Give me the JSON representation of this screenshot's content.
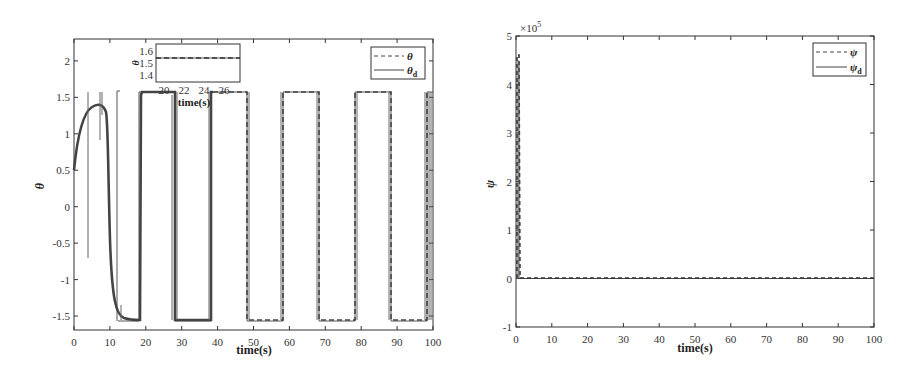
{
  "chart_data": [
    {
      "type": "line",
      "title": "",
      "xlabel": "time(s)",
      "ylabel": "θ",
      "xlim": [
        0,
        100
      ],
      "ylim": [
        -1.7,
        2.3
      ],
      "xticks": [
        0,
        10,
        20,
        30,
        40,
        50,
        60,
        70,
        80,
        90,
        100
      ],
      "yticks": [
        -1.5,
        -1,
        -0.5,
        0,
        0.5,
        1,
        1.5,
        2
      ],
      "ytick_labels": [
        "-1.5",
        "-1",
        "-0.5",
        "0",
        "0.5",
        "1",
        "1.5",
        "2"
      ],
      "grid": false,
      "legend_position": "upper right",
      "series": [
        {
          "name": "θ",
          "style": "dashed",
          "description": "actual attitude angle; initial transient rises from ~0.5 to ~1.35 around t=5-7s, drops to ~-1.57 by t≈12s, then tracks square wave"
        },
        {
          "name": "θ_d",
          "style": "solid",
          "description": "desired square wave alternating between 1.57 and -1.57"
        }
      ],
      "square_wave": {
        "high": 1.57,
        "low": -1.57,
        "high_intervals": [
          [
            18,
            28
          ],
          [
            38,
            48
          ],
          [
            58,
            68
          ],
          [
            78,
            88
          ],
          [
            98,
            100
          ]
        ],
        "low_intervals": [
          [
            12,
            18
          ],
          [
            28,
            38
          ],
          [
            48,
            58
          ],
          [
            68,
            78
          ],
          [
            88,
            98
          ]
        ]
      },
      "transient": {
        "x": [
          0,
          1,
          2,
          3,
          4,
          5,
          6,
          7,
          8,
          9,
          10,
          11,
          12,
          14,
          16,
          18
        ],
        "y": [
          0.5,
          0.9,
          1.1,
          1.25,
          1.32,
          1.36,
          1.37,
          1.33,
          1.1,
          -0.2,
          -1.3,
          -1.5,
          -1.55,
          -1.57,
          -1.57,
          -1.57
        ]
      },
      "inset": {
        "xlabel": "time(s)",
        "ylabel": "θ",
        "xlim": [
          19,
          28
        ],
        "ylim": [
          1.35,
          1.65
        ],
        "xticks": [
          20,
          22,
          24,
          26
        ],
        "yticks": [
          1.4,
          1.5,
          1.6
        ],
        "value": 1.57
      }
    },
    {
      "type": "line",
      "title": "",
      "xlabel": "time(s)",
      "ylabel": "ψ",
      "y_scale_note": "×10^5",
      "xlim": [
        0,
        100
      ],
      "ylim": [
        -1,
        5
      ],
      "xticks": [
        0,
        10,
        20,
        30,
        40,
        50,
        60,
        70,
        80,
        90,
        100
      ],
      "yticks": [
        -1,
        0,
        1,
        2,
        3,
        4,
        5
      ],
      "grid": false,
      "legend_position": "upper right",
      "series": [
        {
          "name": "ψ",
          "style": "dashed",
          "x": [
            0,
            0.3,
            0.6,
            0.9,
            1.2,
            100
          ],
          "y": [
            0,
            4.6,
            4.6,
            0.05,
            0,
            0
          ]
        },
        {
          "name": "ψ_d",
          "style": "solid",
          "x": [
            0,
            100
          ],
          "y": [
            0,
            0
          ]
        }
      ]
    }
  ],
  "left": {
    "xlabel": "time(s)",
    "ylabel": "θ",
    "xticks": [
      "0",
      "10",
      "20",
      "30",
      "40",
      "50",
      "60",
      "70",
      "80",
      "90",
      "100"
    ],
    "yticks": [
      "-1.5",
      "-1",
      "-0.5",
      "0",
      "0.5",
      "1",
      "1.5",
      "2"
    ],
    "legend": [
      "θ",
      "θ",
      "d"
    ],
    "inset": {
      "xticks": [
        "20",
        "22",
        "24",
        "26"
      ],
      "yticks": [
        "1.4",
        "1.5",
        "1.6"
      ],
      "xlabel": "time(s)",
      "ylabel": "θ"
    }
  },
  "right": {
    "xlabel": "time(s)",
    "ylabel": "ψ",
    "multiplier": "×10",
    "multiplier_exp": "5",
    "xticks": [
      "0",
      "10",
      "20",
      "30",
      "40",
      "50",
      "60",
      "70",
      "80",
      "90",
      "100"
    ],
    "yticks": [
      "-1",
      "0",
      "1",
      "2",
      "3",
      "4",
      "5"
    ],
    "legend": [
      "ψ",
      "ψ",
      "d"
    ]
  }
}
